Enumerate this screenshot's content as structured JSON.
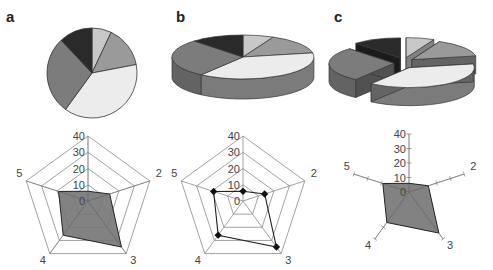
{
  "panels": [
    {
      "label": "a",
      "pie_style": "2D pie",
      "radar_style": "filled radar"
    },
    {
      "label": "b",
      "pie_style": "3D pie",
      "radar_style": "radar with markers"
    },
    {
      "label": "c",
      "pie_style": "exploded 3D pie",
      "radar_style": "filled radar, axes only"
    }
  ],
  "colors": {
    "slice_light_gray": "#c8c8c8",
    "slice_mid_gray": "#9a9a9a",
    "slice_pale": "#ececec",
    "slice_dark_gray": "#7c7c7c",
    "slice_black": "#2a2a2a",
    "radar_fill": "#777777",
    "grid": "#8a8a8a"
  },
  "chart_data": [
    {
      "type": "pie",
      "title": "a",
      "labels": [
        "slice 1",
        "slice 2",
        "slice 3",
        "slice 4",
        "slice 5"
      ],
      "values": [
        7,
        15,
        38,
        28,
        12
      ],
      "colors": [
        "#c8c8c8",
        "#9a9a9a",
        "#ececec",
        "#7c7c7c",
        "#2a2a2a"
      ]
    },
    {
      "type": "pie",
      "title": "b",
      "variant": "3D",
      "labels": [
        "slice 1",
        "slice 2",
        "slice 3",
        "slice 4",
        "slice 5"
      ],
      "values": [
        7,
        15,
        38,
        28,
        12
      ]
    },
    {
      "type": "pie",
      "title": "c",
      "variant": "3D exploded",
      "labels": [
        "slice 1",
        "slice 2",
        "slice 3",
        "slice 4",
        "slice 5"
      ],
      "values": [
        7,
        15,
        38,
        28,
        12
      ]
    },
    {
      "type": "radar",
      "title": "a",
      "axes": [
        "1",
        "2",
        "3",
        "4",
        "5"
      ],
      "axis_labels_shown": [
        "2",
        "3",
        "4",
        "5"
      ],
      "ticks": [
        0,
        10,
        20,
        30,
        40
      ],
      "range": [
        0,
        40
      ],
      "values": [
        6,
        14,
        35,
        26,
        19
      ],
      "style": "filled"
    },
    {
      "type": "radar",
      "title": "b",
      "axes": [
        "1",
        "2",
        "3",
        "4",
        "5"
      ],
      "axis_labels_shown": [
        "2",
        "3",
        "4",
        "5"
      ],
      "ticks": [
        0,
        10,
        20,
        30,
        40
      ],
      "range": [
        0,
        40
      ],
      "values": [
        6,
        14,
        35,
        26,
        19
      ],
      "style": "line-markers"
    },
    {
      "type": "radar",
      "title": "c",
      "axes": [
        "1",
        "2",
        "3",
        "4",
        "5"
      ],
      "axis_labels_shown": [
        "2",
        "3",
        "4",
        "5"
      ],
      "ticks": [
        0,
        10,
        20,
        30,
        40
      ],
      "range": [
        0,
        40
      ],
      "values": [
        6,
        14,
        35,
        26,
        19
      ],
      "style": "filled-axes-only"
    }
  ]
}
